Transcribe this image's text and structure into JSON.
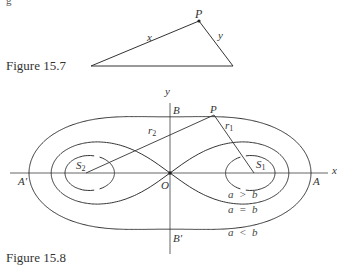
{
  "top_fragment": "g",
  "figure_15_7": {
    "caption": "Figure 15.7",
    "vertices": {
      "left": [
        91,
        66
      ],
      "P": [
        199,
        21
      ],
      "right": [
        233,
        66
      ]
    },
    "labels": {
      "P": "P",
      "x": "x",
      "y": "y"
    }
  },
  "figure_15_8": {
    "caption": "Figure 15.8",
    "origin": [
      170,
      173
    ],
    "foci": {
      "S1": [
        254,
        173
      ],
      "S2": [
        86,
        173
      ]
    },
    "point_P": [
      214,
      115
    ],
    "x_axis": {
      "from": 10,
      "to": 328,
      "label": "x"
    },
    "y_axis": {
      "from": 103,
      "to": 254,
      "label": "y"
    },
    "y_scale": 0.74,
    "ovals": [
      {
        "name": "a > b",
        "a": 63
      },
      {
        "name": "a = b",
        "a": 84
      },
      {
        "name": "a < b",
        "a": 113.2
      }
    ],
    "labels": {
      "P": "P",
      "B": "B",
      "B_prime": "B′",
      "A": "A",
      "A_prime": "A′",
      "O": "O",
      "S1": "S",
      "S1_sub": "1",
      "S2": "S",
      "S2_sub": "2",
      "r1": "r",
      "r1_sub": "1",
      "r2": "r",
      "r2_sub": "2",
      "rel_gt": "a  >  b",
      "rel_eq": "a  =  b",
      "rel_lt": "a  <  b"
    }
  }
}
